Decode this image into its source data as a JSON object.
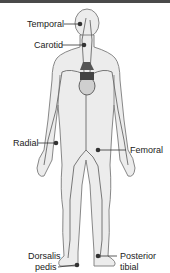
{
  "figure": {
    "type": "anatomical-diagram",
    "colors": {
      "body_fill": "#ececec",
      "outline": "#7a7a7a",
      "vessel": "#6a6a6a",
      "marker": "#333333",
      "top_bar": "#4a4a4a"
    }
  },
  "labels": {
    "temporal": "Temporal",
    "carotid": "Carotid",
    "radial": "Radial",
    "femoral": "Femoral",
    "dorsalis_pedis_line1": "Dorsalis",
    "dorsalis_pedis_line2": "pedis",
    "posterior_tibial_line1": "Posterior",
    "posterior_tibial_line2": "tibial"
  }
}
